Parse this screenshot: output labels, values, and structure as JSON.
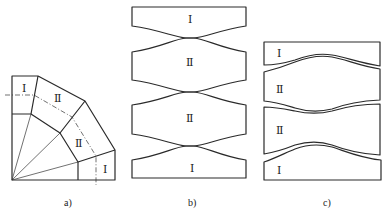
{
  "figure": {
    "panels": [
      {
        "id": "a",
        "caption": "a)",
        "description": "Elbow made of four segments around a quarter arc with radial division lines",
        "segment_labels": [
          "Ⅰ",
          "Ⅱ",
          "Ⅱ",
          "Ⅰ"
        ]
      },
      {
        "id": "b",
        "caption": "b)",
        "description": "Unfolded segments nested with convex/concave curved edges touching at center",
        "segment_labels": [
          "Ⅰ",
          "Ⅱ",
          "Ⅱ",
          "Ⅰ"
        ]
      },
      {
        "id": "c",
        "caption": "c)",
        "description": "Alternative nesting with wavy curved edges overlapping",
        "segment_labels": [
          "Ⅰ",
          "Ⅱ",
          "Ⅱ",
          "Ⅰ"
        ]
      }
    ]
  }
}
